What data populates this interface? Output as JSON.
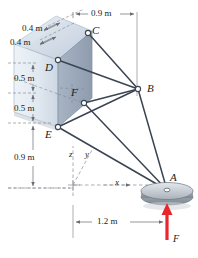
{
  "figure": {
    "background": "#ffffff"
  },
  "colors": {
    "box_front": "#e2e9f1",
    "box_side": "#9aa9bb",
    "box_top": "#cfd9e6",
    "box_edge": "#6d7a8c",
    "cable": "#3b4452",
    "dimension_line": "#6b6b73",
    "dashed_axis": "#8b8b95",
    "force_arrow": "#e8262b",
    "disc_top": "#c8cdd4",
    "disc_side": "#8f979f",
    "text": "#1b1b22"
  },
  "points": [
    {
      "id": "C",
      "label": "C",
      "x": 88,
      "y": 33,
      "label_x": 92,
      "label_y": 29
    },
    {
      "id": "D",
      "label": "D",
      "x": 58,
      "y": 60,
      "label_x": 45,
      "label_y": 65
    },
    {
      "id": "F",
      "label": "F",
      "x": 84,
      "y": 103,
      "label_x": 72,
      "label_y": 91
    },
    {
      "id": "E",
      "label": "E",
      "x": 58,
      "y": 127,
      "label_x": 45,
      "label_y": 133
    },
    {
      "id": "B",
      "label": "B",
      "x": 138,
      "y": 89,
      "label_x": 147,
      "label_y": 84
    },
    {
      "id": "A",
      "label": "A",
      "x": 167,
      "y": 190,
      "label_x": 170,
      "label_y": 176
    }
  ],
  "cables": [
    {
      "from": "C",
      "to": "B"
    },
    {
      "from": "D",
      "to": "B"
    },
    {
      "from": "F",
      "to": "B"
    },
    {
      "from": "E",
      "to": "B"
    },
    {
      "from": "B",
      "to": "A"
    },
    {
      "from": "F",
      "to": "A"
    },
    {
      "from": "E",
      "to": "A"
    }
  ],
  "dimensions": [
    {
      "id": "top-horizontal",
      "value": "0.9 m",
      "text_x": 92,
      "text_y": 12
    },
    {
      "id": "upper-diagonal-1",
      "value": "0.4 m",
      "text_x": 22,
      "text_y": 28
    },
    {
      "id": "upper-diagonal-2",
      "value": "0.4 m",
      "text_x": 10,
      "text_y": 42
    },
    {
      "id": "left-vertical-1",
      "value": "0.5 m",
      "text_x": 15,
      "text_y": 78
    },
    {
      "id": "left-vertical-2",
      "value": "0.5 m",
      "text_x": 15,
      "text_y": 108
    },
    {
      "id": "left-vertical-3",
      "value": "0.9 m",
      "text_x": 15,
      "text_y": 157
    },
    {
      "id": "bottom-horizontal",
      "value": "1.2 m",
      "text_x": 108,
      "text_y": 228
    }
  ],
  "axes": [
    {
      "id": "z-axis",
      "label": "z",
      "text_x": 70,
      "text_y": 152
    },
    {
      "id": "y-axis",
      "label": "y",
      "text_x": 86,
      "text_y": 152
    },
    {
      "id": "x-axis",
      "label": "x",
      "text_x": 116,
      "text_y": 181
    }
  ],
  "force": {
    "id": "F",
    "label": "F",
    "label_x": 173,
    "label_y": 238,
    "direction": "up",
    "color": "#e8262b"
  },
  "disc": {
    "id": "disc-A",
    "center_x": 167,
    "center_y": 193,
    "rx": 26,
    "ry": 8
  }
}
